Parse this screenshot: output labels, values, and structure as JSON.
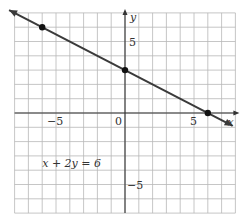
{
  "chart_data": {
    "type": "line",
    "title": "",
    "equation": "x + 2y = 6",
    "xlabel": "x",
    "ylabel": "y",
    "xlim": [
      -8,
      8
    ],
    "ylim": [
      -7,
      7
    ],
    "grid": true,
    "x_ticks_labeled": [
      -5,
      0,
      5
    ],
    "y_ticks_labeled": [
      5,
      -5
    ],
    "tick_labels": {
      "x_neg5": "−5",
      "origin": "0",
      "x_pos5": "5",
      "y_pos5": "5",
      "y_neg5": "−5"
    },
    "series": [
      {
        "name": "x + 2y = 6",
        "points": [
          [
            -6,
            6
          ],
          [
            0,
            3
          ],
          [
            6,
            0
          ]
        ],
        "line_extends_both_directions": true
      }
    ],
    "annotations": [
      {
        "text": "x + 2y = 6",
        "x": -6,
        "y": -3.5
      }
    ],
    "colors": {
      "line": "#3a3a3a",
      "grid": "#b8b8b8",
      "axis": "#333333",
      "points": "#111111"
    }
  }
}
